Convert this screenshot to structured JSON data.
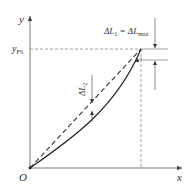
{
  "diagram": {
    "axes": {
      "x_label": "x",
      "y_label": "y",
      "origin_label": "O",
      "y_marker_label": "y",
      "y_marker_subscript": "FS"
    },
    "annotations": {
      "delta_l1_main": "ΔL",
      "delta_l1_sub": "1",
      "equals": " = ΔL",
      "delta_l1_max_sub": "max",
      "delta_l2_main": "ΔL",
      "delta_l2_sub": "2"
    },
    "curves": [
      {
        "name": "actual-curve",
        "style": "solid",
        "description": "nonlinear calibration curve from O to full-scale point"
      },
      {
        "name": "reference-line",
        "style": "dashed",
        "description": "straight reference line from O to full-scale point"
      }
    ],
    "colors": {
      "axis": "#555555",
      "curve": "#222222",
      "dashed": "#777777",
      "text": "#333333"
    }
  }
}
